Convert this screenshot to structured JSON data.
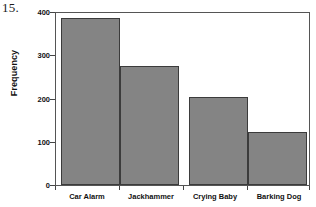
{
  "exercise": {
    "number": "15."
  },
  "chart_data": {
    "type": "bar",
    "title": "",
    "xlabel": "",
    "ylabel": "Frequency",
    "categories": [
      "Car Alarm",
      "Jackhammer",
      "Crying Baby",
      "Barking Dog"
    ],
    "values": [
      390,
      279,
      206,
      123
    ],
    "ylim": [
      0,
      400
    ],
    "yticks": [
      0,
      100,
      200,
      300,
      400
    ],
    "ytick_labels": [
      "0",
      "100",
      "200",
      "300",
      "400"
    ],
    "grid": false,
    "legend": false,
    "bar_fill_color": "#848484",
    "bar_edge_color": "#3b3b3b",
    "axis_color": "#555555",
    "text_color": "#111111"
  }
}
